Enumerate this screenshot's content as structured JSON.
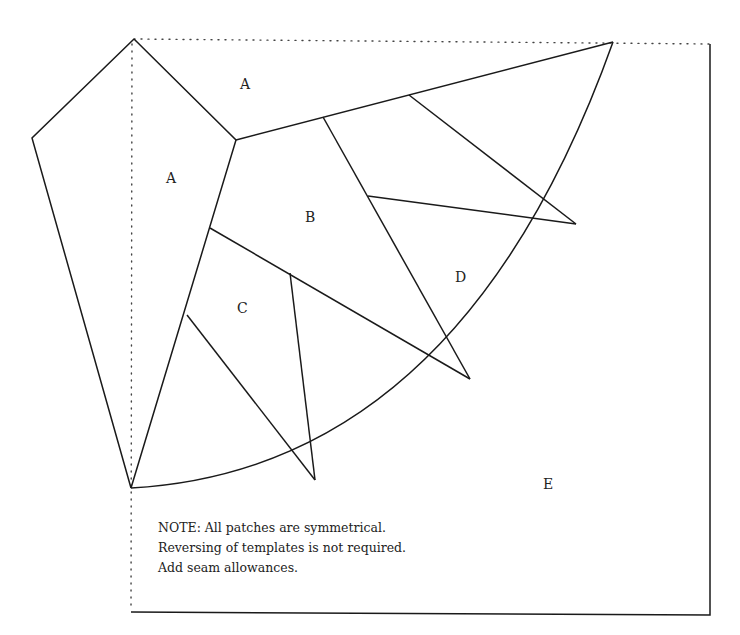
{
  "diagram": {
    "patch_labels": {
      "a_outer": "A",
      "a_inner": "A",
      "b": "B",
      "c": "C",
      "d": "D",
      "e": "E"
    },
    "line_styles": {
      "seam": "solid",
      "fold": "dotted"
    },
    "colors": {
      "line": "#1a1a1a",
      "background": "#ffffff"
    }
  },
  "note": {
    "lines": [
      "NOTE: All patches are symmetrical.",
      "Reversing of templates is not required.",
      "Add seam allowances."
    ]
  }
}
